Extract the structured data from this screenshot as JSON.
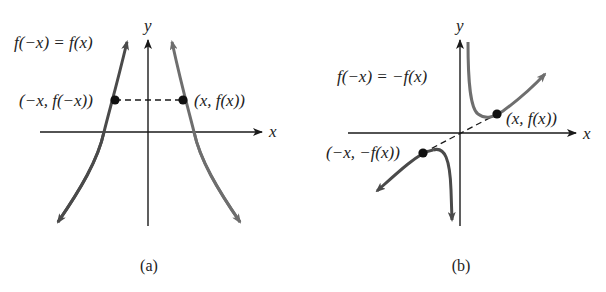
{
  "figure": {
    "panels": [
      {
        "id": "a",
        "caption": "(a)",
        "equation": "f(−x) = f(x)",
        "axis_x_label": "x",
        "axis_y_label": "y",
        "point_left_label": "(−x, f(−x))",
        "point_right_label": "(x, f(x))",
        "symmetry": "even (symmetric about y-axis)"
      },
      {
        "id": "b",
        "caption": "(b)",
        "equation": "f(−x) = −f(x)",
        "axis_x_label": "x",
        "axis_y_label": "y",
        "point_left_label": "(−x, −f(x))",
        "point_right_label": "(x, f(x))",
        "symmetry": "odd (symmetric about origin)"
      }
    ]
  },
  "colors": {
    "axis": "#1a1a1a",
    "curve_dark": "#4a4a4a",
    "curve_light": "#6e6e6e",
    "point": "#111111",
    "text": "#222222"
  }
}
